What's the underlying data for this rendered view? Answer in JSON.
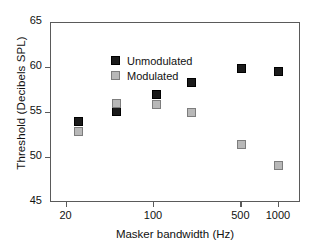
{
  "chart_data": {
    "type": "scatter",
    "title": "",
    "xlabel": "Masker bandwidth (Hz)",
    "ylabel": "Threshold (Decibels SPL)",
    "xscale": "log",
    "xlim": [
      15,
      1500
    ],
    "ylim": [
      45,
      65
    ],
    "xticks": [
      20,
      100,
      500,
      1000
    ],
    "xtick_labels": [
      "20",
      "100",
      "500",
      "1000"
    ],
    "yticks": [
      45,
      50,
      55,
      60,
      65
    ],
    "ytick_labels": [
      "45",
      "50",
      "55",
      "60",
      "65"
    ],
    "grid": false,
    "legend_position": "top-left",
    "x": [
      25,
      50,
      105,
      200,
      500,
      1000
    ],
    "series": [
      {
        "name": "Unmodulated",
        "marker": "filled-square",
        "color": "#1a1a1a",
        "values": [
          54.1,
          55.2,
          57.1,
          58.4,
          60.0,
          59.6
        ]
      },
      {
        "name": "Modulated",
        "marker": "gray-square",
        "color": "#b8b8b8",
        "values": [
          53.0,
          56.1,
          56.0,
          55.1,
          51.5,
          49.2
        ]
      }
    ]
  },
  "legend": {
    "entries": [
      {
        "label": "Unmodulated"
      },
      {
        "label": "Modulated"
      }
    ]
  },
  "colors": {
    "unmodulated": "#1a1a1a",
    "modulated": "#b8b8b8",
    "axis": "#5a5a5a",
    "text": "#111111",
    "background": "#ffffff"
  }
}
